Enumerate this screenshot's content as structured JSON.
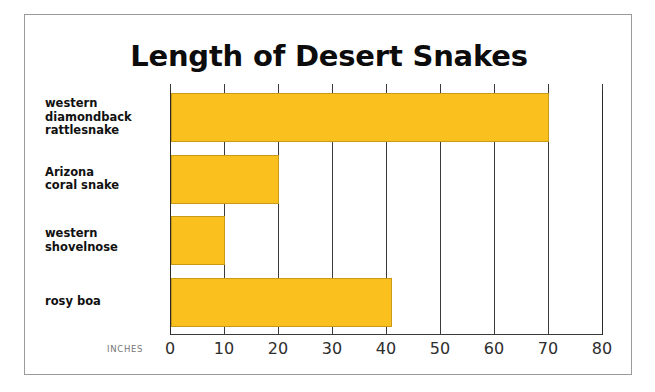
{
  "figure": {
    "title": "Length of Desert Snakes",
    "axis_title": "INCHES",
    "bar_color": "#FAC01E",
    "bar_edge_color": "#C99A18",
    "grid_color": "#3A3A3A",
    "frame_color": "#9A9A9A",
    "title_color": "#0C0C0C"
  },
  "chart_data": {
    "type": "bar",
    "orientation": "horizontal",
    "title": "Length of Desert Snakes",
    "xlabel": "INCHES",
    "ylabel": "",
    "xlim": [
      0,
      80
    ],
    "xticks": [
      0,
      10,
      20,
      30,
      40,
      50,
      60,
      70,
      80
    ],
    "xtick_labels": [
      "0",
      "10",
      "20",
      "30",
      "40",
      "50",
      "60",
      "70",
      "80"
    ],
    "grid": true,
    "legend": null,
    "categories": [
      "western diamondback rattlesnake",
      "Arizona coral snake",
      "western shovelnose",
      "rosy boa"
    ],
    "category_label_lines": [
      [
        "western",
        "diamondback",
        "rattlesnake"
      ],
      [
        "Arizona",
        "coral snake"
      ],
      [
        "western",
        "shovelnose"
      ],
      [
        "rosy boa"
      ]
    ],
    "values": [
      70,
      20,
      10,
      41
    ],
    "units": "inches"
  }
}
